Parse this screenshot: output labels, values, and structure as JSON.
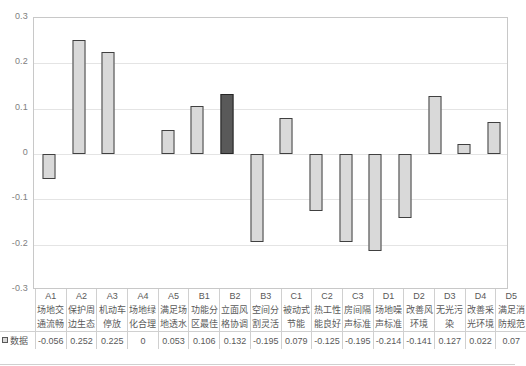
{
  "chart_data": {
    "type": "bar",
    "title": "",
    "xlabel": "",
    "ylabel": "",
    "ylim": [
      -0.3,
      0.3
    ],
    "yticks": [
      0.3,
      0.2,
      0.1,
      0,
      -0.1,
      -0.2,
      -0.3
    ],
    "ytick_labels": [
      "0.3",
      "0.2",
      "0.1",
      "0",
      "-0.1",
      "-0.2",
      "-0.3"
    ],
    "grid": true,
    "legend": [
      "数据"
    ],
    "legend_position": "bottom-left",
    "highlight_index": 6,
    "categories": [
      "A1",
      "A2",
      "A3",
      "A4",
      "A5",
      "B1",
      "B2",
      "B3",
      "C1",
      "C2",
      "C3",
      "D1",
      "D2",
      "D3",
      "D4",
      "D5"
    ],
    "category_names": [
      "场地交通流畅",
      "保护周边生态",
      "机动车停放",
      "场地绿化合理",
      "满足场地透水",
      "功能分区最佳",
      "立面风格协调",
      "空间分割灵活",
      "被动式节能",
      "热工性能良好",
      "房间隔声标准",
      "场地噪声标准",
      "改善风环境",
      "无光污染",
      "改善采光环境",
      "满足消防规范"
    ],
    "values": [
      -0.056,
      0.252,
      0.225,
      0,
      0.053,
      0.106,
      0.132,
      -0.195,
      0.079,
      -0.125,
      -0.195,
      -0.214,
      -0.141,
      0.127,
      0.022,
      0.07
    ],
    "value_labels": [
      "-0.056",
      "0.252",
      "0.225",
      "0",
      "0.053",
      "0.106",
      "0.132",
      "-0.195",
      "0.079",
      "-0.125",
      "-0.195",
      "-0.214",
      "-0.141",
      "0.127",
      "0.022",
      "0.07"
    ],
    "series_name": "数据",
    "colors": {
      "bar_fill": "#d9d9d9",
      "bar_border": "#404040",
      "highlight_fill": "#595959",
      "highlight_border": "#262626",
      "gridline": "#e4e4e4",
      "plot_border": "#c8c8c8",
      "text": "#595959"
    }
  },
  "table": {
    "row_header_label": "数据",
    "code_row": [
      "A1",
      "A2",
      "A3",
      "A4",
      "A5",
      "B1",
      "B2",
      "B3",
      "C1",
      "C2",
      "C3",
      "D1",
      "D2",
      "D3",
      "D4",
      "D5"
    ],
    "name_line1": [
      "场地交",
      "保护周",
      "机动车",
      "场地绿",
      "满足场",
      "功能分",
      "立面风",
      "空间分",
      "被动式",
      "热工性",
      "房间隔",
      "场地噪",
      "改善风",
      "无光污",
      "改善采",
      "满足消"
    ],
    "name_line2": [
      "通流畅",
      "边生态",
      "停放",
      "化合理",
      "地透水",
      "区最佳",
      "格协调",
      "割灵活",
      "节能",
      "能良好",
      "声标准",
      "声标准",
      "环境",
      "染",
      "光环境",
      "防规范"
    ],
    "value_row": [
      "-0.056",
      "0.252",
      "0.225",
      "0",
      "0.053",
      "0.106",
      "0.132",
      "-0.195",
      "0.079",
      "-0.125",
      "-0.195",
      "-0.214",
      "-0.141",
      "0.127",
      "0.022",
      "0.07"
    ]
  }
}
